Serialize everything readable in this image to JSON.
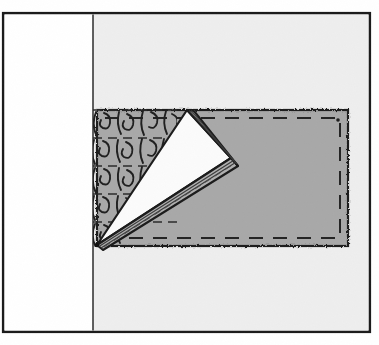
{
  "figure": {
    "name": "folded-fabric-corner-diagram",
    "title": "",
    "caption": "",
    "canvas": {
      "width": 379,
      "height": 345
    },
    "colors": {
      "page_background": "#ffffff",
      "panel_background": "#eeeeee",
      "fabric_gray": "#a8a8a8",
      "fabric_gray_shadow": "#9a9a9a",
      "flap_white": "#fbfbfb",
      "ink": "#1a1a1a",
      "stitch": "#262626",
      "texture_ink": "#202020"
    },
    "outer_frame": {
      "name": "outer-border",
      "x": 2,
      "y": 12,
      "width": 369,
      "height": 321,
      "stroke_width": 2.5,
      "stroke": "#1a1a1a",
      "fill": "#ffffff"
    },
    "panel": {
      "name": "gray-page-panel",
      "x": 93,
      "y": 13,
      "width": 277,
      "height": 319,
      "fill": "#eeeeee"
    },
    "white_margin": {
      "name": "white-margin-strip",
      "x": 3,
      "y": 13,
      "width": 90,
      "height": 319,
      "fill": "#ffffff"
    },
    "fold_line": {
      "name": "vertical-fold-line",
      "x": 93,
      "y1": 13,
      "y2": 332,
      "stroke_width": 1.4
    },
    "fabric_piece": {
      "name": "gray-fabric-rectangle",
      "x": 97,
      "y": 110,
      "width": 251,
      "height": 136,
      "fill": "#a8a8a8",
      "edge_style": "scalloped",
      "scallop_radius": 3.1
    },
    "stitch_line": {
      "name": "dashed-stitch-line",
      "inset": 8,
      "dash": "13 9",
      "stroke_width": 1.9
    },
    "folded_flap": {
      "name": "folded-back-corner-flap",
      "apex": {
        "x": 97,
        "y": 245
      },
      "tip": {
        "x": 187,
        "y": 110
      },
      "point": {
        "x": 231,
        "y": 158
      },
      "fill": "#fbfbfb",
      "crease_count": 3
    },
    "texture": {
      "name": "knit-stitch-texture",
      "x": 93,
      "y": 107,
      "width": 84,
      "height": 140,
      "rows": 5,
      "row_height": 28,
      "stitches_per_row": 3,
      "row_dash": "9 6"
    }
  },
  "labels": {
    "items": []
  }
}
